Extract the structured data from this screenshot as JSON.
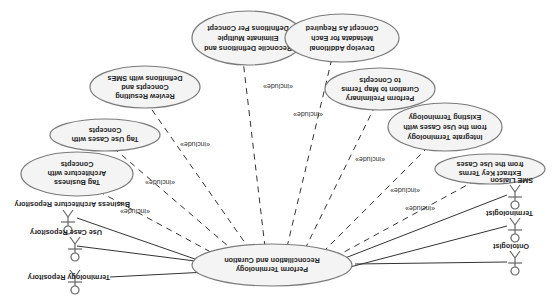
{
  "diagram": {
    "type": "UML use case diagram",
    "orientation": "rotated 180 degrees",
    "central_use_case": {
      "lines": [
        "Perform Terminology",
        "Reconciliation and Curation"
      ]
    },
    "actors_left": [
      {
        "label": "Business Architecture Repository"
      },
      {
        "label": "Use Case Repository"
      },
      {
        "label": "Terminology Repository"
      }
    ],
    "actors_right": [
      {
        "label": "SME Liaison"
      },
      {
        "label": "Terminologist"
      },
      {
        "label": "Ontologist"
      }
    ],
    "included_use_cases": [
      {
        "lines": [
          "Tag Business",
          "Architecture with",
          "Concepts"
        ]
      },
      {
        "lines": [
          "Tag Use Cases with",
          "Concepts"
        ]
      },
      {
        "lines": [
          "Review Resulting",
          "Concepts and",
          "Definitions with SMEs"
        ]
      },
      {
        "lines": [
          "Reconcile Definitions and",
          "Eliminate Multiple",
          "Definitions Per Concept"
        ]
      },
      {
        "lines": [
          "Develop Additional",
          "Metadata for Each",
          "Concept As Required"
        ]
      },
      {
        "lines": [
          "Perform Preliminary",
          "Curation to Map Terms",
          "to Concepts"
        ]
      },
      {
        "lines": [
          "Integrate Terminology",
          "from the Use Cases with",
          "Existing Terminology"
        ]
      },
      {
        "lines": [
          "Extract Key Terms",
          "from the Use Cases"
        ]
      }
    ],
    "include_label": "«include»"
  }
}
